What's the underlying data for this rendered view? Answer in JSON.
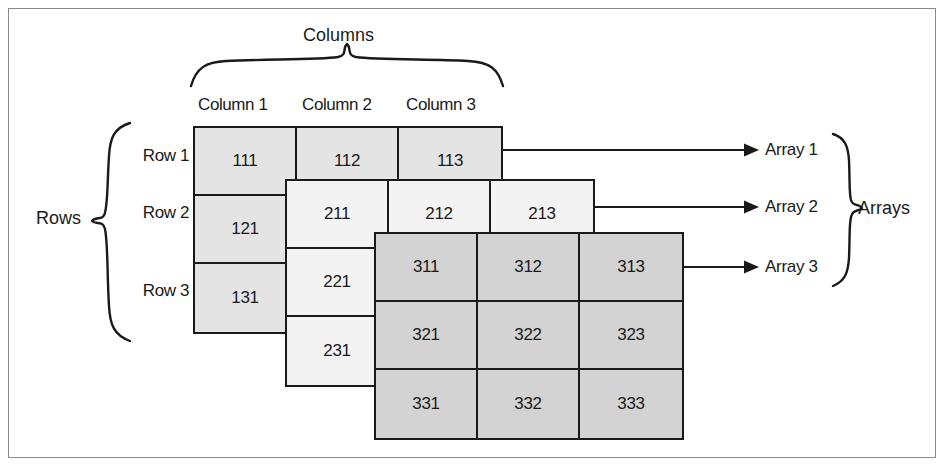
{
  "figure": {
    "title_columns": "Columns",
    "title_rows": "Rows",
    "title_arrays": "Arrays"
  },
  "column_headers": [
    "Column 1",
    "Column 2",
    "Column 3"
  ],
  "row_headers": [
    "Row 1",
    "Row 2",
    "Row 3"
  ],
  "array_labels": [
    "Array 1",
    "Array 2",
    "Array 3"
  ],
  "arrays": [
    {
      "name": "Array 1",
      "fill": "#e4e4e4",
      "cells": [
        [
          "111",
          "112",
          "113"
        ],
        [
          "121",
          "122",
          "123"
        ],
        [
          "131",
          "132",
          "133"
        ]
      ]
    },
    {
      "name": "Array 2",
      "fill": "#f3f3f3",
      "cells": [
        [
          "211",
          "212",
          "213"
        ],
        [
          "221",
          "222",
          "223"
        ],
        [
          "231",
          "232",
          "233"
        ]
      ]
    },
    {
      "name": "Array 3",
      "fill": "#d3d3d3",
      "cells": [
        [
          "311",
          "312",
          "313"
        ],
        [
          "321",
          "322",
          "323"
        ],
        [
          "331",
          "332",
          "333"
        ]
      ]
    }
  ],
  "colors": {
    "ink": "#1a1a1a",
    "frame": "#8a8a8a",
    "array1_fill": "#e4e4e4",
    "array2_fill": "#f3f3f3",
    "array3_fill": "#d3d3d3",
    "background": "#ffffff"
  }
}
